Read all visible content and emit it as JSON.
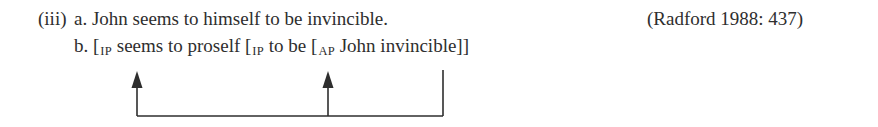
{
  "example": {
    "number": "(iii)",
    "a": {
      "label": "a.",
      "text": "John seems to himself to be invincible."
    },
    "citation": "(Radford 1988: 437)",
    "b": {
      "label": "b.",
      "bracket1": "[",
      "sub1": "IP",
      "seg1": " seems to proself ",
      "bracket2": "[",
      "sub2": "IP",
      "seg2": " to be ",
      "bracket3": "[",
      "sub3": "AP",
      "seg3": " John invincible]]"
    }
  },
  "diagram": {
    "type": "movement-arrows",
    "source": "John",
    "targets": [
      "IP (matrix) subject",
      "IP (embedded) subject"
    ],
    "stroke_color": "#2e2e2e"
  }
}
